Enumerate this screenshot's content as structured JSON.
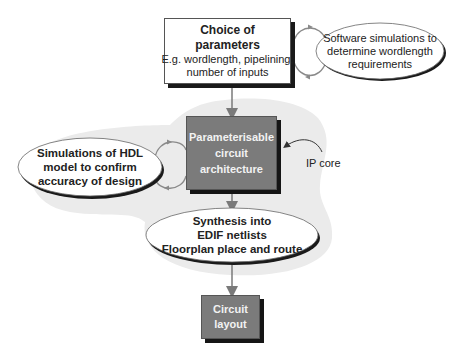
{
  "diagram": {
    "colors": {
      "background": "#ffffff",
      "shaded_region": "#ebebeb",
      "dark_box": "#7b7b7b",
      "shadow": "#1a1a1a",
      "arrow": "#7a7a7a",
      "loop": "#8a8a8a"
    },
    "nodes": {
      "choice": {
        "title_line1": "Choice of",
        "title_line2": "parameters",
        "detail_line1": "E.g. wordlength, pipelining,",
        "detail_line2": "number of inputs"
      },
      "software_sim": {
        "line1": "Software simulations to",
        "line2": "determine wordlength",
        "line3": "requirements"
      },
      "ip_box": {
        "line1": "Parameterisable",
        "line2": "circuit",
        "line3": "architecture"
      },
      "hdl_sim": {
        "line1": "Simulations of HDL",
        "line2": "model to confirm",
        "line3": "accuracy of design"
      },
      "synthesis": {
        "line1": "Synthesis into",
        "line2": "EDIF netlists",
        "line3": "Floorplan place and route"
      },
      "layout": {
        "line1": "Circuit",
        "line2": "layout"
      }
    },
    "annotations": {
      "ip_core": "IP core"
    },
    "edges": [
      {
        "from": "choice",
        "to": "ip_box",
        "type": "arrow"
      },
      {
        "from": "ip_box",
        "to": "synthesis",
        "type": "arrow"
      },
      {
        "from": "synthesis",
        "to": "layout",
        "type": "arrow"
      },
      {
        "from": "choice",
        "to": "software_sim",
        "type": "loop"
      },
      {
        "from": "ip_box",
        "to": "hdl_sim",
        "type": "loop"
      },
      {
        "from": "ip_core_label",
        "to": "ip_box",
        "type": "curved-arrow"
      }
    ]
  }
}
